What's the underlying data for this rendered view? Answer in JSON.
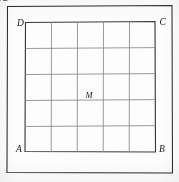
{
  "figure": {
    "kind": "geometry-diagram",
    "labels": {
      "a": "A",
      "b": "B",
      "c": "C",
      "d": "D",
      "m": "M"
    },
    "colors": {
      "outer_frame": "#2b2b2b",
      "inner_square": "#3a3a3a",
      "grid": "#8e8e8e",
      "diagonal": "#4a4a4a",
      "label": "#1a1a1a",
      "background": "#fdfdfd"
    },
    "geometry": {
      "outer_frame": {
        "points": "7.5,6.5 172,5.5 172.5,173 7,172.5",
        "stroke_width": 1.05
      },
      "inner_square": {
        "points": "25.5,22.5 155,21.5 155.5,152 25,151.5",
        "stroke_width": 1.15
      },
      "grid": {
        "rows": 5,
        "cols": 5,
        "vertical_lines": [
          "51.5,22.2 51.2,151.7",
          "77.5,22.0 77.2,151.6",
          "103.5,21.9 103.2,151.6",
          "129.5,21.7 129.2,151.6"
        ],
        "horizontal_lines": [
          "25.4,48.5 155.1,47.6",
          "25.3,74.5 155.2,73.6",
          "25.2,100.5 155.3,99.6",
          "25.1,126.5 155.4,125.6"
        ]
      },
      "diagonals": [
        {
          "name": "diagonal-D-to-B",
          "x1": 7.5,
          "y1": 6.5,
          "x2": 172.5,
          "y2": 173
        },
        {
          "name": "diagonal-A-to-C",
          "x1": 7,
          "y1": 172.5,
          "x2": 172,
          "y2": 5.5
        }
      ],
      "intersection_point": {
        "x": 89.8,
        "y": 89.4
      },
      "label_positions": {
        "d": {
          "x": 17.0,
          "y": 26.0
        },
        "c": {
          "x": 159.5,
          "y": 25.0
        },
        "a": {
          "x": 16.0,
          "y": 152.0
        },
        "b": {
          "x": 159.0,
          "y": 151.5
        },
        "m": {
          "x": 85.5,
          "y": 97.5
        }
      }
    }
  }
}
